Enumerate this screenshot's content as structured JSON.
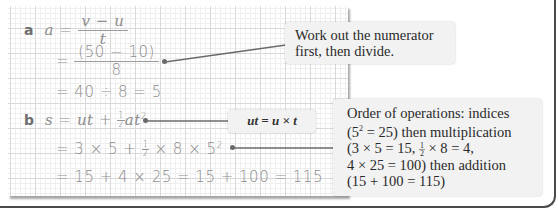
{
  "part_a": {
    "label": "a",
    "line1": {
      "lhs": "a",
      "eq": "=",
      "num": "v − u",
      "den": "t"
    },
    "line2": {
      "eq": "=",
      "num": "(50 − 10)",
      "den": "8"
    },
    "line3": "= 40 ÷ 8 = 5",
    "callout": "Work out the numerator first, then divide."
  },
  "part_b": {
    "label": "b",
    "line1": {
      "lhs": "s",
      "eq": "=",
      "term1": "ut",
      "plus": "+",
      "half_num": "1",
      "half_den": "2",
      "term2": "at",
      "exp": "2"
    },
    "line2": {
      "text": "= 3 × 5 + ",
      "half_num": "1",
      "half_den": "2",
      "rest": " × 8 × 5",
      "exp": "2"
    },
    "line3": "= 15 + 4 × 25 = 15 + 100 = 115",
    "ut_callout": "ut = u × t",
    "callout": {
      "l1": "Order of operations: indices",
      "l2a": "(5",
      "l2exp": "2",
      "l2b": " = 25) then multiplication",
      "l3a": "(3 × 5 = 15, ",
      "l3num": "1",
      "l3den": "2",
      "l3b": " × 8 = 4,",
      "l4": "4 × 25 = 100) then addition",
      "l5": "(15 + 100 = 115)"
    }
  },
  "colors": {
    "text": "#8d8d8d",
    "callout_bg": "#f2f2f2",
    "connector": "#6a6a6a",
    "frame": "#4a4a4a"
  }
}
